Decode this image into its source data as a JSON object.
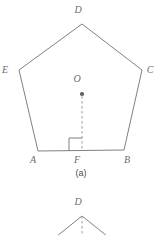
{
  "figure": {
    "caption": "(a)",
    "stroke_color": "#808080",
    "dash_color": "#9a9a9a",
    "label_color": "#6d6d6d",
    "background": "#ffffff",
    "pentagon": {
      "name": "regular-pentagon-ABCDE",
      "vertices": [
        {
          "label": "A",
          "x": 38,
          "y": 151,
          "label_x": 33,
          "label_y": 163
        },
        {
          "label": "B",
          "x": 124,
          "y": 150,
          "label_x": 127,
          "label_y": 163
        },
        {
          "label": "C",
          "x": 142,
          "y": 70,
          "label_x": 150,
          "label_y": 73
        },
        {
          "label": "D",
          "x": 82,
          "y": 24,
          "label_x": 78,
          "label_y": 13
        },
        {
          "label": "E",
          "x": 19,
          "y": 70,
          "label_x": 5,
          "label_y": 73
        }
      ],
      "center": {
        "label": "O",
        "x": 82,
        "y": 94,
        "label_x": 77,
        "label_y": 82,
        "dot_radius": 2.1
      },
      "foot": {
        "label": "F",
        "x": 82,
        "y": 151,
        "label_x": 77,
        "label_y": 163
      },
      "apothem_segment": {
        "name": "OF",
        "from": "O",
        "to": "F",
        "style": "dashed"
      },
      "right_angle_marker": {
        "size": 13,
        "at": "F",
        "opens": "left"
      }
    },
    "lower_figure": {
      "name": "partial-triangle-apex-D",
      "apex": {
        "label": "D",
        "x": 82,
        "y": 216,
        "label_x": 78,
        "label_y": 205
      },
      "left_end": {
        "x": 52,
        "y": 240
      },
      "right_end": {
        "x": 112,
        "y": 240
      },
      "axis": {
        "from_y": 216,
        "to_y": 240,
        "style": "dashed"
      }
    }
  }
}
